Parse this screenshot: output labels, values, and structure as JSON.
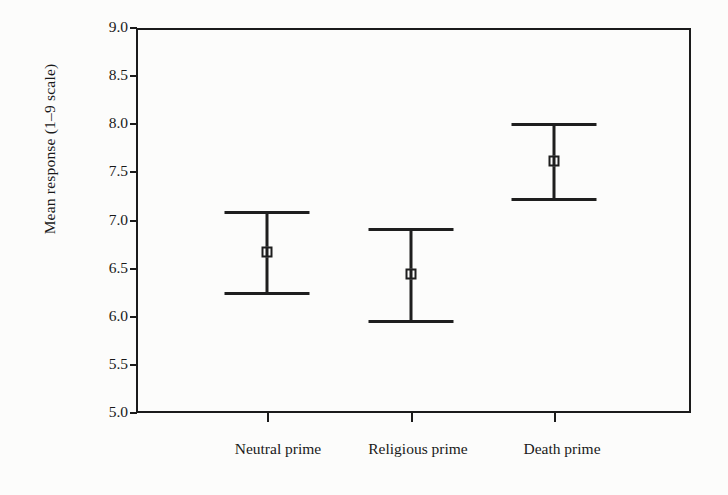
{
  "chart_data": {
    "type": "scatter",
    "title": "",
    "xlabel": "",
    "ylabel": "Mean response (1–9 scale)",
    "categories": [
      "Neutral prime",
      "Religious prime",
      "Death prime"
    ],
    "values": [
      6.67,
      6.44,
      7.62
    ],
    "error_low": [
      6.25,
      5.96,
      7.22
    ],
    "error_high": [
      7.09,
      6.91,
      8.0
    ],
    "ylim": [
      5.0,
      9.0
    ],
    "yticks": [
      "5.0",
      "5.5",
      "6.0",
      "6.5",
      "7.0",
      "7.5",
      "8.0",
      "8.5",
      "9.0"
    ],
    "ytick_values": [
      5.0,
      5.5,
      6.0,
      6.5,
      7.0,
      7.5,
      8.0,
      8.5,
      9.0
    ],
    "grid": false,
    "legend": "none",
    "marker_style": "open-square",
    "errorbar_style": "capped",
    "line_color": "#1e1e1e",
    "background_color": "#fcfcfb",
    "series": [
      {
        "name": "Mean response",
        "points": [
          {
            "category": "Neutral prime",
            "mean": 6.67,
            "lower": 6.25,
            "upper": 7.09
          },
          {
            "category": "Religious prime",
            "mean": 6.44,
            "lower": 5.96,
            "upper": 6.91
          },
          {
            "category": "Death prime",
            "mean": 7.62,
            "lower": 7.22,
            "upper": 8.0
          }
        ]
      }
    ]
  }
}
